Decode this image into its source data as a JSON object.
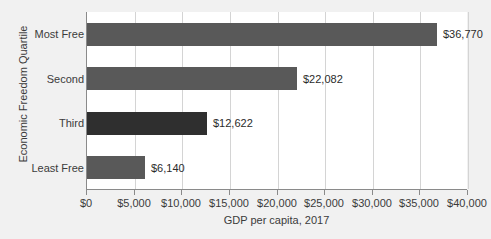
{
  "chart_data": {
    "type": "bar",
    "orientation": "horizontal",
    "title": "",
    "xlabel": "GDP per capita, 2017",
    "ylabel": "Economic Freedom Quartile",
    "categories": [
      "Most Free",
      "Second",
      "Third",
      "Least Free"
    ],
    "values": [
      36770,
      22082,
      12622,
      6140
    ],
    "value_labels": [
      "$36,770",
      "$22,082",
      "$12,622",
      "$6,140"
    ],
    "xlim": [
      0,
      40000
    ],
    "xticks": [
      0,
      5000,
      10000,
      15000,
      20000,
      25000,
      30000,
      35000,
      40000
    ],
    "xticklabels": [
      "$0",
      "$5,000",
      "$10,000",
      "$15,000",
      "$20,000",
      "$25,000",
      "$30,000",
      "$35,000",
      "$40,000"
    ],
    "grid": "vertical",
    "legend": "none",
    "bar_colors": [
      "#595959",
      "#595959",
      "#2f2f2f",
      "#595959"
    ],
    "plot_background": "#ffffff",
    "figure_background": "#f1f1f1",
    "axis_color": "#8a8a8a",
    "gridline_color": "#d4d4d4",
    "text_color": "#3b3b3b"
  }
}
